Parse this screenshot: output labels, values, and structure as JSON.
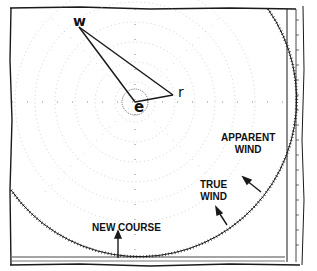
{
  "diagram": {
    "type": "maneuvering-board wind vector diagram",
    "colors": {
      "ink": "#1a1a1a",
      "paper": "#ffffff",
      "grid_dots": "#b8b8b8"
    },
    "points": {
      "e": {
        "label": "e",
        "x": 135,
        "y": 102
      },
      "w": {
        "label": "w",
        "x": 79,
        "y": 27
      },
      "r": {
        "label": "r",
        "x": 173,
        "y": 95
      }
    },
    "vectors": [
      {
        "from": "e",
        "to": "w"
      },
      {
        "from": "w",
        "to": "r"
      },
      {
        "from": "e",
        "to": "r"
      }
    ],
    "labels": {
      "apparent_wind_line1": "APPARENT",
      "apparent_wind_line2": "WIND",
      "true_wind_line1": "TRUE",
      "true_wind_line2": "WIND",
      "new_course": "NEW COURSE"
    },
    "arrows": [
      {
        "name": "apparent-wind-arrow",
        "from": [
          261,
          192
        ],
        "to": [
          244,
          178
        ]
      },
      {
        "name": "true-wind-arrow",
        "from": [
          227,
          225
        ],
        "to": [
          216,
          209
        ]
      },
      {
        "name": "new-course-arrow",
        "from": [
          118,
          258
        ],
        "to": [
          118,
          232
        ]
      }
    ]
  }
}
